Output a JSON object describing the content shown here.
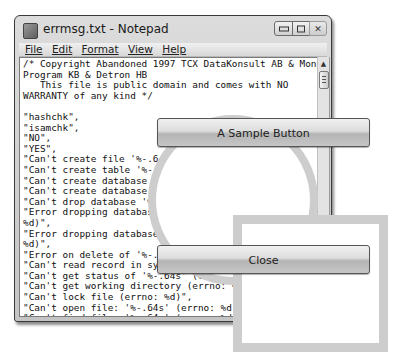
{
  "window": {
    "title": "errmsg.txt - Notepad",
    "controls": {
      "minimize": "minimize",
      "maximize": "maximize",
      "close": "close"
    }
  },
  "menu": {
    "items": [
      {
        "label": "File",
        "accel": "F"
      },
      {
        "label": "Edit",
        "accel": "E"
      },
      {
        "label": "Format",
        "accel": "o"
      },
      {
        "label": "View",
        "accel": "V"
      },
      {
        "label": "Help",
        "accel": "H"
      }
    ]
  },
  "editor": {
    "text": "/* Copyright Abandoned 1997 TCX DataKonsult AB & Monty\nProgram KB & Detron HB\n   This file is public domain and comes with NO\nWARRANTY of any kind */\n\n\"hashchk\",\n\"isamchk\",\n\"NO\",\n\"YES\",\n\"Can't create file '%-.64s' (errno: %d)\",\n\"Can't create table '%-.64s' (errno: %d)\",\n\"Can't create database '%-.64s'. (errno: %d)\",\n\"Can't create database '%-.64s'. Database exists\",\n\"Can't drop database '%-.64s'. Database doesn't exist\",\n\"Error dropping database (can't delete '%-.64s', errno:\n%d)\",\n\"Error dropping database (can't rmdir '%-.64s', errno:\n%d)\",\n\"Error on delete of '%-.64s' (errno: %d)\",\n\"Can't read record in system table\",\n\"Can't get status of '%-.64s' (errno: %d)\",\n\"Can't get working directory (errno: %d)\",\n\"Can't lock file (errno: %d)\",\n\"Can't open file: '%-.64s' (errno: %d)\",\n\"Can't find file: '%-.64s' (errno: %d)\",\n\"Can't read dir of '%-.64s' (errno: %d)\",\n\"Can't change dir to '%-.64s' (errno: %d)\","
  },
  "overlay": {
    "sample_button": "A Sample Button",
    "close_button": "Close",
    "ring_color": "#cdcdcd"
  }
}
